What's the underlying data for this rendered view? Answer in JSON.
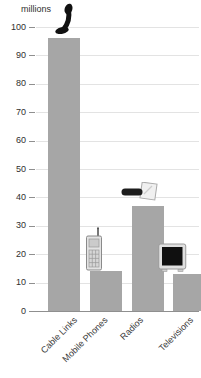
{
  "chart_data": {
    "type": "bar",
    "title": "",
    "ylabel": "millions",
    "xlabel": "",
    "categories": [
      "Cable Links",
      "Mobile Phones",
      "Radios",
      "Televisions"
    ],
    "values": [
      96,
      14,
      37,
      13
    ],
    "ylim": [
      0,
      100
    ],
    "ytick_step": 10,
    "grid": true,
    "legend": "none",
    "bar_color": "#a6a6a6",
    "icons": [
      "telephone-handset",
      "mobile-phone",
      "radio",
      "television"
    ]
  },
  "colors": {
    "bar": "#a6a6a6",
    "gridline": "#e3e3e3",
    "axis": "#8f8f8f",
    "text": "#3a3a3a"
  }
}
